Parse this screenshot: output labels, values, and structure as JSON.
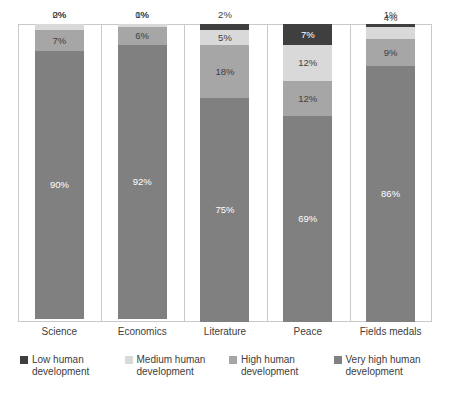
{
  "chart_data": {
    "type": "bar",
    "subtype": "stacked-100-percent",
    "title": "",
    "subtitle": "",
    "xlabel": "",
    "ylabel": "",
    "ylim": [
      0,
      100
    ],
    "grid": false,
    "legend_position": "bottom",
    "value_suffix": "%",
    "categories": [
      "Science",
      "Economics",
      "Literature",
      "Peace",
      "Fields medals"
    ],
    "series": [
      {
        "name": "Low human development",
        "color": "#3f3f3f",
        "label_color": "#ffffff",
        "values": [
          0,
          0,
          2,
          7,
          1
        ],
        "labels": [
          "0%",
          "0%",
          "2%",
          "7%",
          "1%"
        ]
      },
      {
        "name": "Medium human development",
        "color": "#d9d9d9",
        "label_color": "#404040",
        "values": [
          2,
          1,
          5,
          12,
          4
        ],
        "labels": [
          "2%",
          "1%",
          "5%",
          "12%",
          "4%"
        ]
      },
      {
        "name": "High human development",
        "color": "#a6a6a6",
        "label_color": "#404040",
        "values": [
          7,
          6,
          18,
          12,
          9
        ],
        "labels": [
          "7%",
          "6%",
          "18%",
          "12%",
          "9%"
        ]
      },
      {
        "name": "Very high human development",
        "color": "#808080",
        "label_color": "#ffffff",
        "values": [
          90,
          92,
          75,
          69,
          86
        ],
        "labels": [
          "90%",
          "92%",
          "75%",
          "69%",
          "86%"
        ]
      }
    ],
    "legend": [
      "Low human development",
      "Medium human development",
      "High human development",
      "Very high human development"
    ],
    "colors": {
      "low": "#3f3f3f",
      "medium": "#d9d9d9",
      "high": "#a6a6a6",
      "very_high": "#808080",
      "frame": "#c9c9c9",
      "text": "#404040",
      "background": "#ffffff"
    }
  },
  "axis": {
    "ticks": [
      "Science",
      "Economics",
      "Literature",
      "Peace",
      "Fields medals"
    ]
  },
  "legend": {
    "items": [
      {
        "label_line1": "Low human",
        "label_line2": "development",
        "color": "#3f3f3f"
      },
      {
        "label_line1": "Medium human",
        "label_line2": "development",
        "color": "#d9d9d9"
      },
      {
        "label_line1": "High human",
        "label_line2": "development",
        "color": "#a6a6a6"
      },
      {
        "label_line1": "Very high human",
        "label_line2": "development",
        "color": "#808080"
      }
    ]
  }
}
